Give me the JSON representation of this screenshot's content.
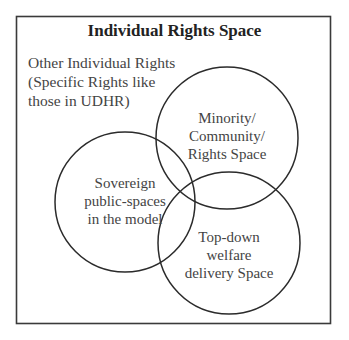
{
  "diagram": {
    "title": "Individual Rights Space",
    "outer_label": {
      "lines": [
        "Other Individual Rights",
        "(Specific Rights like",
        "those in UDHR)"
      ]
    },
    "circles": [
      {
        "id": "minority",
        "lines": [
          "Minority/",
          "Community/",
          "Rights Space"
        ]
      },
      {
        "id": "sovereign",
        "lines": [
          "Sovereign",
          "public-spaces",
          "in the model"
        ]
      },
      {
        "id": "welfare",
        "lines": [
          "Top-down",
          "welfare",
          "delivery Space"
        ]
      }
    ],
    "colors": {
      "stroke": "#2b2b2b",
      "text": "#444444",
      "background": "#ffffff"
    }
  }
}
